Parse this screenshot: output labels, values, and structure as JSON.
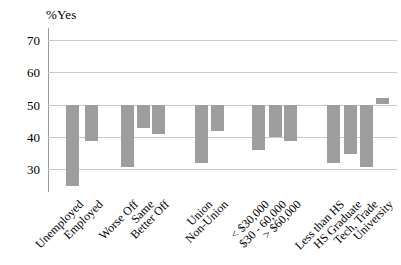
{
  "chart_data": {
    "type": "bar",
    "title": "",
    "ylabel": "%Yes",
    "xlabel": "",
    "baseline": 50,
    "ylim": [
      23,
      73
    ],
    "yticks": [
      30,
      40,
      50,
      60,
      70
    ],
    "grid": true,
    "legend": "none",
    "categories": [
      "Unemployed",
      "Employed",
      "Worse Off",
      "Same",
      "Better Off",
      "Union",
      "Non-Union",
      "< $30,000",
      "$30 - 60,000",
      "> $60,000",
      "Less than HS",
      "HS Graduate",
      "Tech, Trade",
      "University"
    ],
    "values": [
      25,
      39,
      31,
      43,
      41,
      32,
      42,
      36,
      40,
      39,
      32,
      35,
      31,
      52
    ],
    "groups": [
      2,
      3,
      2,
      3,
      4
    ],
    "bar_color": "#9d9d9d",
    "grid_color": "#c9c9c9",
    "axis_color": "#9a9a9a",
    "text_color": "#000000"
  }
}
